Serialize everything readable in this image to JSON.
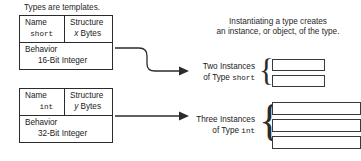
{
  "left_caption": "Types are templates.",
  "right_caption": {
    "line1": "Instantiating a type creates",
    "line2": "an instance, or object, of the type."
  },
  "type_boxes": [
    {
      "id": "short",
      "name_label": "Name",
      "name_value": "short",
      "structure_label": "Structure",
      "structure_value_italic": "x",
      "structure_value_rest": " Bytes",
      "behavior_label": "Behavior",
      "behavior_value": "16-Bit Integer"
    },
    {
      "id": "int",
      "name_label": "Name",
      "name_value": "int",
      "structure_label": "Structure",
      "structure_value_italic": "y",
      "structure_value_rest": " Bytes",
      "behavior_label": "Behavior",
      "behavior_value": "32-Bit Integer"
    }
  ],
  "instance_groups": [
    {
      "id": "short",
      "label_line1": "Two Instances",
      "label_line2_prefix": "of Type ",
      "label_line2_mono": "short",
      "count": 2
    },
    {
      "id": "int",
      "label_line1": "Three Instances",
      "label_line2_prefix": "of Type ",
      "label_line2_mono": "int",
      "count": 3
    }
  ],
  "colors": {
    "stroke": "#2b2b2b",
    "text": "#1a1a1a",
    "background": "#ffffff"
  }
}
